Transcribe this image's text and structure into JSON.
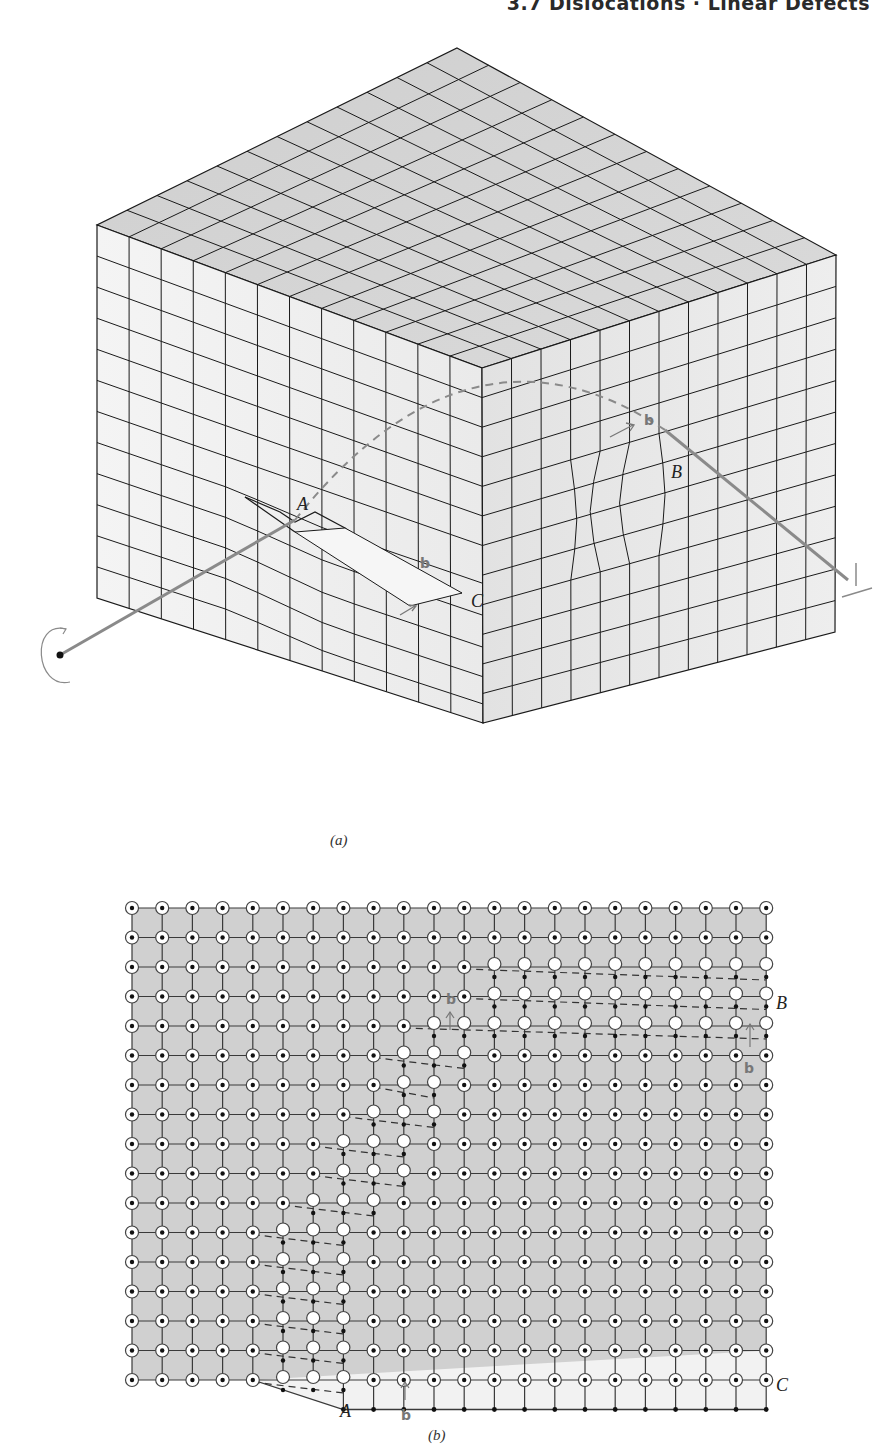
{
  "page": {
    "running_head": "3.7 Dislocations · Linear Defects"
  },
  "figure_a": {
    "caption": "(a)",
    "labels": {
      "A": "A",
      "B": "B",
      "C": "C",
      "b1": "b",
      "b2": "b"
    },
    "symbols": {
      "dislocation_symbol": "⊥"
    },
    "colors": {
      "top_face": "#d4d4d4",
      "side_face": "#ececec",
      "line": "#1a1a1a",
      "dislocation_line": "#8a8a8a"
    }
  },
  "figure_b": {
    "caption": "(b)",
    "labels": {
      "A": "A",
      "B": "B",
      "C": "C",
      "b_left": "b",
      "b_right": "b",
      "b_bottom": "b"
    },
    "grid": {
      "columns": 22,
      "rows": 17,
      "x0": 132,
      "y0": 908,
      "dx": 30.2,
      "dy": 29.5
    },
    "colors": {
      "background": "#d0d0d0",
      "lower_plane": "#f2f2f2",
      "line": "#3a3a3a"
    }
  }
}
